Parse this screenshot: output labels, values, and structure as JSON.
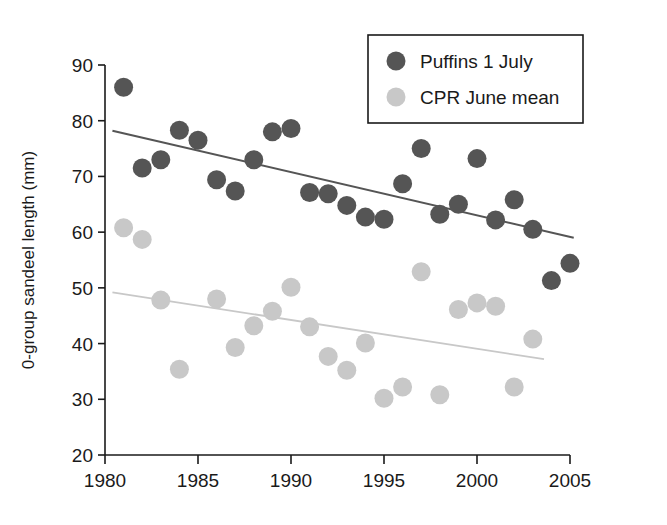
{
  "chart_data": {
    "type": "scatter",
    "title": "",
    "xlabel": "",
    "ylabel": "0-group sandeel length (mm)",
    "xlim": [
      1980,
      2005
    ],
    "ylim": [
      20,
      90
    ],
    "xticks": [
      "1980",
      "1985",
      "1990",
      "1995",
      "2000",
      "2005"
    ],
    "xtick_values": [
      1980,
      1985,
      1990,
      1995,
      2000,
      2005
    ],
    "yticks": [
      "20",
      "30",
      "40",
      "50",
      "60",
      "70",
      "80",
      "90"
    ],
    "ytick_values": [
      20,
      30,
      40,
      50,
      60,
      70,
      80,
      90
    ],
    "grid": false,
    "legend_position": "top-right",
    "colors": {
      "puffins": "#555555",
      "cpr": "#c8c8c8",
      "axis": "#1a1a1a",
      "puffins_trend": "#555555",
      "cpr_trend": "#c8c8c8"
    },
    "series": [
      {
        "name": "Puffins 1 July",
        "color": "#555555",
        "marker": "circle",
        "x": [
          1981,
          1982,
          1983,
          1984,
          1985,
          1986,
          1987,
          1988,
          1989,
          1990,
          1991,
          1992,
          1993,
          1994,
          1995,
          1996,
          1997,
          1998,
          1999,
          2000,
          2001,
          2002,
          2003,
          2004,
          2005
        ],
        "values": [
          86.0,
          71.5,
          73.0,
          78.3,
          76.5,
          69.4,
          67.4,
          73.0,
          78.0,
          78.6,
          67.1,
          66.9,
          64.8,
          62.7,
          62.3,
          68.7,
          75.0,
          63.2,
          65.0,
          73.2,
          62.2,
          65.8,
          60.5,
          51.3,
          54.4
        ],
        "trend": {
          "x0": 1980.4,
          "y0": 78.2,
          "x1": 2005.2,
          "y1": 59.0
        }
      },
      {
        "name": "CPR June mean",
        "color": "#c8c8c8",
        "marker": "circle",
        "x": [
          1981,
          1982,
          1983,
          1984,
          1986,
          1987,
          1988,
          1989,
          1990,
          1991,
          1992,
          1993,
          1994,
          1995,
          1996,
          1997,
          1998,
          1999,
          2000,
          2001,
          2002,
          2003
        ],
        "values": [
          60.8,
          58.7,
          47.8,
          35.4,
          48.0,
          39.3,
          43.2,
          45.8,
          50.1,
          43.0,
          37.7,
          35.2,
          40.1,
          30.2,
          32.2,
          52.9,
          30.8,
          46.1,
          47.3,
          46.7,
          32.2,
          40.8
        ],
        "trend": {
          "x0": 1980.4,
          "y0": 49.2,
          "x1": 2003.6,
          "y1": 37.2
        }
      }
    ]
  },
  "legend": {
    "items": [
      {
        "label": "Puffins 1 July",
        "color": "#555555"
      },
      {
        "label": "CPR June mean",
        "color": "#c8c8c8"
      }
    ]
  }
}
